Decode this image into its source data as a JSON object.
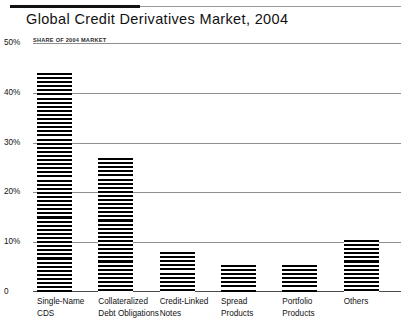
{
  "chart_data": {
    "type": "bar",
    "title": "Global Credit Derivatives Market, 2004",
    "subtitle": "SHARE OF 2004 MARKET",
    "xlabel": "",
    "ylabel": "",
    "ylim": [
      0,
      50
    ],
    "grid": true,
    "legend": "none",
    "value_suffix": "%",
    "categories": [
      "Single-Name CDS",
      "Collateralized Debt Obligations",
      "Credit-Linked Notes",
      "Spread Products",
      "Portfolio Products",
      "Others"
    ],
    "category_lines": [
      [
        "Single-Name",
        "CDS"
      ],
      [
        "Collateralized",
        "Debt Obligations"
      ],
      [
        "Credit-Linked",
        "Notes"
      ],
      [
        "Spread",
        "Products"
      ],
      [
        "Portfolio",
        "Products"
      ],
      [
        "Others"
      ]
    ],
    "values": [
      44,
      27,
      8,
      5.5,
      5.5,
      10.5
    ],
    "yticks": [
      {
        "value": 50,
        "label": "50%"
      },
      {
        "value": 40,
        "label": "40%"
      },
      {
        "value": 30,
        "label": "30%"
      },
      {
        "value": 20,
        "label": "20%"
      },
      {
        "value": 10,
        "label": "10%"
      },
      {
        "value": 0,
        "label": "0"
      }
    ],
    "colors": {
      "bar_stripe": "#000000",
      "bar_background": "#ffffff",
      "gridline": "#8f8f8f",
      "baseline": "#4a4a4a",
      "title": "#111111",
      "rule_accent": "#111111"
    }
  }
}
